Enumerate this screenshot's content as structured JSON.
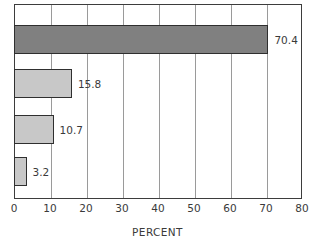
{
  "chart_data": {
    "type": "bar",
    "orientation": "horizontal",
    "title": "",
    "xlabel": "PERCENT",
    "ylabel": "",
    "xlim": [
      0,
      80
    ],
    "xticks": [
      0,
      10,
      20,
      30,
      40,
      50,
      60,
      70,
      80
    ],
    "xtick_labels": [
      "0",
      "10",
      "20",
      "30",
      "40",
      "50",
      "60",
      "70",
      "80"
    ],
    "grid": "vertical",
    "legend": "none",
    "categories": [
      "",
      "",
      "",
      ""
    ],
    "values": [
      70.4,
      15.8,
      10.7,
      3.2
    ],
    "data_labels": [
      "70.4",
      "15.8",
      "10.7",
      "3.2"
    ],
    "bars": [
      {
        "value": 70.4,
        "label": "70.4",
        "fill": "#808080",
        "stroke": "#2f2f2f"
      },
      {
        "value": 15.8,
        "label": "15.8",
        "fill": "#c8c8c8",
        "stroke": "#2f2f2f"
      },
      {
        "value": 10.7,
        "label": "10.7",
        "fill": "#c8c8c8",
        "stroke": "#2f2f2f"
      },
      {
        "value": 3.2,
        "label": "3.2",
        "fill": "#c8c8c8",
        "stroke": "#2f2f2f"
      }
    ],
    "colors": {
      "frame": "#3d3d3d",
      "gridline": "#9a9a9a",
      "text": "#3a3a3a",
      "background": "#ffffff",
      "bar_dark": "#808080",
      "bar_light": "#c8c8c8"
    }
  }
}
